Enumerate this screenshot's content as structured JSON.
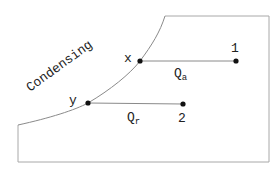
{
  "diagram": {
    "curve_label": "Condensing",
    "points": {
      "x": {
        "label": "x"
      },
      "one": {
        "label": "1"
      },
      "y": {
        "label": "y"
      },
      "two": {
        "label": "2"
      }
    },
    "edges": {
      "qa": {
        "symbol": "Q",
        "subscript": "a"
      },
      "qr": {
        "symbol": "Q",
        "subscript": "r"
      }
    },
    "colors": {
      "boundary": "#9a9a9a",
      "lines": "#8a8a8a",
      "points": "#111111",
      "text": "#222222"
    }
  }
}
